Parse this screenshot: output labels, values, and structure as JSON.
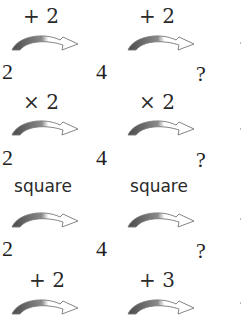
{
  "rows": [
    {
      "ops": [
        "+ 2",
        "+ 2"
      ],
      "numbers": [
        "2",
        "4",
        "?"
      ]
    },
    {
      "ops": [
        "× 2",
        "× 2"
      ],
      "numbers": [
        "2",
        "4",
        "?"
      ]
    },
    {
      "ops": [
        "square",
        "square"
      ],
      "numbers": [
        "2",
        "4",
        "?"
      ]
    },
    {
      "ops": [
        "+ 2",
        "+ 3"
      ],
      "numbers": []
    }
  ],
  "icons": {
    "arrow": "curved-arrow-icon"
  },
  "colors": {
    "arrow_fill_dark": "#666666",
    "arrow_outline": "#888888"
  }
}
